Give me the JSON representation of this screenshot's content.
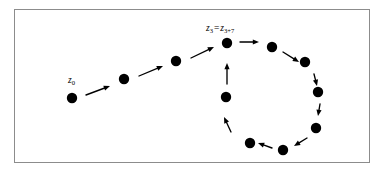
{
  "figure": {
    "background_color": "#ffffff",
    "frame_color": "#8c8c8c",
    "point_color": "#000000",
    "arrow_color": "#000000",
    "point_radius": 5.2,
    "frame": {
      "x": 14,
      "y": 9,
      "width": 356,
      "height": 154
    }
  },
  "labels": {
    "start_point": {
      "base": "z",
      "sub": "0",
      "text": "z0",
      "x": 68,
      "y": 83
    },
    "cycle_point": {
      "base_left": "z",
      "sub_left": "3",
      "equals": "=",
      "base_right": "z",
      "sub_right": "3+7",
      "text": "z3 = z3+7",
      "x": 206,
      "y": 31
    }
  },
  "orbit": {
    "tail_points": [
      {
        "name": "z0",
        "x": 72,
        "y": 98
      },
      {
        "name": "z1",
        "x": 124,
        "y": 79
      },
      {
        "name": "z2",
        "x": 176,
        "y": 61
      }
    ],
    "cycle_points": [
      {
        "name": "z3",
        "x": 227,
        "y": 43
      },
      {
        "name": "z4",
        "x": 272,
        "y": 47
      },
      {
        "name": "z5",
        "x": 305,
        "y": 62
      },
      {
        "name": "z6",
        "x": 318,
        "y": 92
      },
      {
        "name": "z7",
        "x": 316,
        "y": 128
      },
      {
        "name": "z8",
        "x": 283,
        "y": 150
      },
      {
        "name": "z9",
        "x": 250,
        "y": 143
      },
      {
        "name": "z10",
        "x": 226,
        "y": 97
      }
    ],
    "arrows": [
      {
        "name": "arrow-z0-z1",
        "x1": 86,
        "y1": 95,
        "x2": 110,
        "y2": 86
      },
      {
        "name": "arrow-z1-z2",
        "x1": 139,
        "y1": 76,
        "x2": 163,
        "y2": 66
      },
      {
        "name": "arrow-z2-z3",
        "x1": 191,
        "y1": 58,
        "x2": 214,
        "y2": 47
      },
      {
        "name": "arrow-z3-z4",
        "x1": 240,
        "y1": 42,
        "x2": 259,
        "y2": 42
      },
      {
        "name": "arrow-z4-z5",
        "x1": 283,
        "y1": 52,
        "x2": 299,
        "y2": 62
      },
      {
        "name": "arrow-z5-z6",
        "x1": 314,
        "y1": 74,
        "x2": 317,
        "y2": 86
      },
      {
        "name": "arrow-z6-z7",
        "x1": 320,
        "y1": 104,
        "x2": 318,
        "y2": 116
      },
      {
        "name": "arrow-z7-z8",
        "x1": 307,
        "y1": 138,
        "x2": 294,
        "y2": 146
      },
      {
        "name": "arrow-z8-z9",
        "x1": 272,
        "y1": 148,
        "x2": 258,
        "y2": 143
      },
      {
        "name": "arrow-z9-z10",
        "x1": 231,
        "y1": 132,
        "x2": 224,
        "y2": 117
      },
      {
        "name": "arrow-z10-z3",
        "x1": 227,
        "y1": 84,
        "x2": 227,
        "y2": 63
      }
    ]
  }
}
